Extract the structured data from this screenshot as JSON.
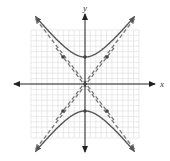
{
  "diagram": {
    "type": "hyperbola-graph",
    "axis_labels": {
      "x": "x",
      "y": "y"
    },
    "colors": {
      "grid": "#dcdcdc",
      "axis": "#222222",
      "curve": "#555555",
      "asymptote": "#777777",
      "point": "#444444"
    },
    "grid": {
      "x_min": -10,
      "x_max": 10,
      "y_min": -10,
      "y_max": 10
    },
    "hyperbola": {
      "orientation": "vertical",
      "center": [
        0,
        0
      ],
      "a": 5,
      "b": 4
    },
    "asymptotes": [
      "y = 5/4 x",
      "y = -5/4 x"
    ],
    "vertices": [
      [
        0,
        5
      ],
      [
        0,
        -5
      ]
    ],
    "marked_points": [
      [
        -4,
        5
      ],
      [
        4,
        5
      ],
      [
        -4,
        -5
      ],
      [
        4,
        -5
      ],
      [
        0,
        0
      ]
    ]
  }
}
